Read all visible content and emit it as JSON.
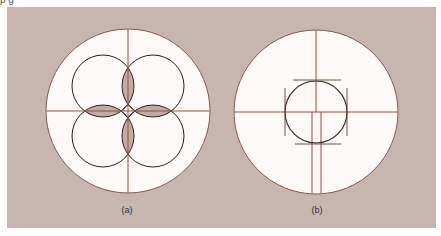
{
  "top_caption_fragment": "p              g",
  "colors": {
    "background": "#ffffff",
    "panel": "#c7b5b0",
    "circle_fill": "#fdfaf8",
    "outer_stroke": "#8a5a4a",
    "crosshair": "#9b4a3c",
    "inner_stroke": "#2a2222",
    "lens_fill": "#c4aaa6"
  },
  "figures": [
    {
      "id": "a",
      "label": "(a)",
      "description": "Large circle with crosshair; four overlapping small circles arranged around the center, with the shaded lens-shaped overlaps along the axes and a small diamond at the center"
    },
    {
      "id": "b",
      "label": "(b)",
      "description": "Large circle with crosshair; single centered small circle bounded by four tangent tick lines; below center the vertical axis splits into a narrow double-line strip"
    }
  ]
}
